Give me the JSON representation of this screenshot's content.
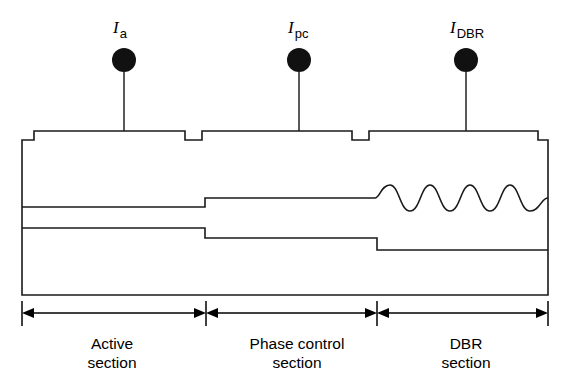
{
  "figure": {
    "background_color": "#ffffff",
    "line_color": "#1a1a1a",
    "pad_color": "#111111"
  },
  "electrodes": [
    {
      "id": "active",
      "symbol": "I",
      "subscript": "a",
      "pad_shape": "filled-circle",
      "label_x": 124,
      "label_y": 26,
      "pad_x": 124,
      "pad_y": 60,
      "pad_r": 12,
      "lead_x": 124,
      "lead_top": 72,
      "lead_bottom": 131
    },
    {
      "id": "phase-control",
      "symbol": "I",
      "subscript": "pc",
      "pad_shape": "filled-circle",
      "label_x": 299,
      "label_y": 26,
      "pad_x": 299,
      "pad_y": 60,
      "pad_r": 12,
      "lead_x": 299,
      "lead_top": 72,
      "lead_bottom": 131
    },
    {
      "id": "dbr",
      "symbol": "I",
      "subscript": "DBR",
      "pad_shape": "filled-circle",
      "label_x": 466,
      "label_y": 26,
      "pad_x": 466,
      "pad_y": 60,
      "pad_r": 12,
      "lead_x": 466,
      "lead_top": 72,
      "lead_bottom": 131
    }
  ],
  "sections": [
    {
      "id": "active-section",
      "line1": "Active",
      "line2": "section",
      "center_x": 112,
      "dim_start": 22,
      "dim_end": 203
    },
    {
      "id": "phase-control-section",
      "line1": "Phase control",
      "line2": "section",
      "center_x": 297,
      "dim_start": 209,
      "dim_end": 374
    },
    {
      "id": "dbr-section",
      "line1": "DBR",
      "line2": "section",
      "center_x": 466,
      "dim_start": 380,
      "dim_end": 548
    }
  ],
  "dimension_axis": {
    "y": 313,
    "tick_top": 301,
    "tick_bottom": 326,
    "label_line1_y": 348,
    "label_line2_y": 367
  },
  "body_outline": {
    "description": "ridge waveguide laser body with contact steps and two isolation notches",
    "path": "M 22 140 L 22 295 L 548 295 L 548 140 L 538 140 L 538 131 L 369 131 L 369 140 L 352 140 L 352 131 L 202 131 L 202 140 L 185 140 L 185 131 L 34 131 L 34 140 Z"
  },
  "waveguide": {
    "upper_path": "M 22 207 L 205 207 L 205 198 L 375 198",
    "lower_path": "M 22 228 L 205 228 L 205 238 L 377 238 L 377 250 L 548 250",
    "grating": {
      "description": "sinusoidal Bragg grating corrugation",
      "periods": 4,
      "start_x": 375,
      "end_x": 548,
      "baseline_y": 198,
      "amplitude": 13
    }
  }
}
